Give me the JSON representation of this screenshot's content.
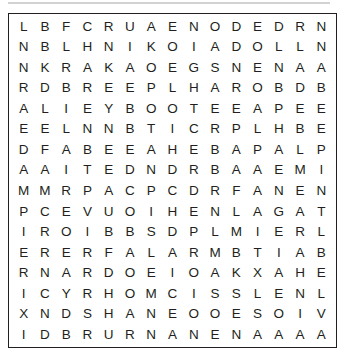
{
  "puzzle": {
    "title": "Word Search Grid",
    "rows": 16,
    "columns": 15,
    "border_color": "#231f20",
    "letter_color": "#231f20",
    "background_color": "#ffffff",
    "top_rule_color": "#d2d2d2",
    "grid": [
      [
        "L",
        "N",
        "N",
        "R",
        "A",
        "E",
        "D",
        "A",
        "M",
        "P",
        "I",
        "E",
        "R",
        "I",
        "X",
        "I"
      ],
      [
        "B",
        "B",
        "K",
        "D",
        "L",
        "E",
        "F",
        "A",
        "M",
        "C",
        "R",
        "R",
        "N",
        "C",
        "N",
        "D"
      ],
      [
        "F",
        "L",
        "R",
        "B",
        "I",
        "L",
        "A",
        "I",
        "R",
        "E",
        "O",
        "E",
        "A",
        "Y",
        "D",
        "B"
      ],
      [
        "C",
        "H",
        "A",
        "R",
        "E",
        "N",
        "B",
        "T",
        "P",
        "V",
        "I",
        "R",
        "R",
        "R",
        "S",
        "R"
      ],
      [
        "R",
        "N",
        "K",
        "E",
        "Y",
        "N",
        "E",
        "E",
        "A",
        "U",
        "B",
        "F",
        "D",
        "H",
        "H",
        "U"
      ],
      [
        "U",
        "I",
        "A",
        "E",
        "B",
        "B",
        "E",
        "D",
        "C",
        "O",
        "B",
        "A",
        "O",
        "O",
        "A",
        "R"
      ],
      [
        "A",
        "K",
        "O",
        "P",
        "O",
        "T",
        "A",
        "N",
        "P",
        "I",
        "S",
        "L",
        "E",
        "M",
        "N",
        "N"
      ],
      [
        "E",
        "O",
        "E",
        "L",
        "O",
        "I",
        "H",
        "D",
        "C",
        "H",
        "D",
        "A",
        "I",
        "C",
        "E",
        "A"
      ],
      [
        "N",
        "I",
        "G",
        "H",
        "T",
        "C",
        "E",
        "R",
        "D",
        "E",
        "P",
        "R",
        "O",
        "I",
        "O",
        "N"
      ],
      [
        "O",
        "A",
        "S",
        "A",
        "E",
        "R",
        "B",
        "B",
        "R",
        "N",
        "L",
        "M",
        "A",
        "S",
        "O",
        "E"
      ],
      [
        "D",
        "D",
        "N",
        "R",
        "E",
        "P",
        "A",
        "A",
        "F",
        "L",
        "M",
        "B",
        "K",
        "S",
        "E",
        "N"
      ],
      [
        "E",
        "O",
        "E",
        "O",
        "A",
        "L",
        "P",
        "A",
        "A",
        "A",
        "I",
        "T",
        "X",
        "L",
        "S",
        "A"
      ],
      [
        "D",
        "L",
        "N",
        "B",
        "P",
        "H",
        "A",
        "E",
        "N",
        "G",
        "E",
        "I",
        "A",
        "E",
        "O",
        "A"
      ],
      [
        "R",
        "L",
        "A",
        "D",
        "E",
        "B",
        "L",
        "M",
        "E",
        "A",
        "R",
        "A",
        "H",
        "N",
        "I",
        "A"
      ],
      [
        "N",
        "N",
        "A",
        "B",
        "E",
        "E",
        "P",
        "I",
        "N",
        "T",
        "L",
        "B",
        "E",
        "L",
        "V",
        "A"
      ],
      [
        "X",
        "D",
        "L",
        "E",
        "H",
        "N",
        "S",
        "B",
        "E",
        "G",
        "N",
        "E",
        "O",
        "N",
        "I",
        "I"
      ]
    ]
  }
}
